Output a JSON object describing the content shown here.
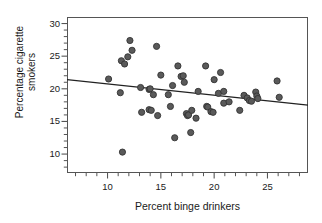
{
  "chart_data": {
    "type": "scatter",
    "title": "",
    "xlabel": "Percent binge drinkers",
    "ylabel": "Percentage cigarette smokers",
    "ylabel_lines": [
      "Percentage cigarette",
      "smokers"
    ],
    "xlim": [
      6.2,
      28.8
    ],
    "ylim": [
      7.1,
      31.0
    ],
    "xticks": [
      10,
      15,
      20,
      25
    ],
    "xtick_labels": [
      "10",
      "15",
      "20",
      "25"
    ],
    "xminor_ticks": [
      7,
      8,
      9,
      11,
      12,
      13,
      14,
      16,
      17,
      18,
      19,
      21,
      22,
      23,
      24,
      26,
      27,
      28
    ],
    "yticks": [
      10,
      15,
      20,
      25,
      30
    ],
    "ytick_labels": [
      "10",
      "15",
      "20",
      "25",
      "30"
    ],
    "yminor_ticks": [
      8,
      9,
      11,
      12,
      13,
      14,
      16,
      17,
      18,
      19,
      21,
      22,
      23,
      24,
      26,
      27,
      28,
      29
    ],
    "grid": false,
    "legend": null,
    "point_color": "#5a5a5a",
    "point_edge_color": "#333333",
    "point_radius_px": 3.1,
    "line_color": "#222222",
    "trendline": {
      "type": "linear-fit",
      "x_start": 6.2,
      "y_start": 21.4,
      "x_end": 28.8,
      "y_end": 17.5,
      "slope": -0.173,
      "intercept": 22.47
    },
    "points": [
      {
        "x": 10.1,
        "y": 21.5
      },
      {
        "x": 11.2,
        "y": 19.4
      },
      {
        "x": 11.3,
        "y": 24.3
      },
      {
        "x": 11.4,
        "y": 10.3
      },
      {
        "x": 11.6,
        "y": 23.8
      },
      {
        "x": 11.9,
        "y": 24.9
      },
      {
        "x": 12.1,
        "y": 27.4
      },
      {
        "x": 12.3,
        "y": 25.9
      },
      {
        "x": 13.1,
        "y": 20.2
      },
      {
        "x": 13.2,
        "y": 16.4
      },
      {
        "x": 13.9,
        "y": 19.9
      },
      {
        "x": 13.9,
        "y": 16.8
      },
      {
        "x": 14.0,
        "y": 20.0
      },
      {
        "x": 14.1,
        "y": 16.7
      },
      {
        "x": 14.3,
        "y": 19.1
      },
      {
        "x": 14.6,
        "y": 26.5
      },
      {
        "x": 14.7,
        "y": 15.9
      },
      {
        "x": 15.0,
        "y": 22.1
      },
      {
        "x": 15.7,
        "y": 19.1
      },
      {
        "x": 15.9,
        "y": 17.3
      },
      {
        "x": 16.1,
        "y": 20.5
      },
      {
        "x": 16.3,
        "y": 12.5
      },
      {
        "x": 16.6,
        "y": 23.5
      },
      {
        "x": 16.9,
        "y": 21.9
      },
      {
        "x": 17.1,
        "y": 22.0
      },
      {
        "x": 17.2,
        "y": 21.0
      },
      {
        "x": 17.4,
        "y": 16.2
      },
      {
        "x": 17.5,
        "y": 15.9
      },
      {
        "x": 17.6,
        "y": 16.0
      },
      {
        "x": 17.8,
        "y": 13.3
      },
      {
        "x": 17.9,
        "y": 16.7
      },
      {
        "x": 18.3,
        "y": 15.5
      },
      {
        "x": 18.5,
        "y": 19.6
      },
      {
        "x": 19.2,
        "y": 23.5
      },
      {
        "x": 19.3,
        "y": 17.3
      },
      {
        "x": 19.4,
        "y": 17.2
      },
      {
        "x": 19.7,
        "y": 16.5
      },
      {
        "x": 19.9,
        "y": 16.4
      },
      {
        "x": 20.0,
        "y": 21.4
      },
      {
        "x": 20.4,
        "y": 19.3
      },
      {
        "x": 20.6,
        "y": 22.5
      },
      {
        "x": 20.9,
        "y": 19.6
      },
      {
        "x": 20.9,
        "y": 17.8
      },
      {
        "x": 21.4,
        "y": 18.0
      },
      {
        "x": 22.4,
        "y": 16.7
      },
      {
        "x": 22.8,
        "y": 19.0
      },
      {
        "x": 23.1,
        "y": 18.6
      },
      {
        "x": 23.3,
        "y": 18.2
      },
      {
        "x": 23.5,
        "y": 18.1
      },
      {
        "x": 23.9,
        "y": 19.5
      },
      {
        "x": 24.0,
        "y": 18.9
      },
      {
        "x": 24.1,
        "y": 18.5
      },
      {
        "x": 25.9,
        "y": 21.2
      },
      {
        "x": 26.1,
        "y": 18.7
      }
    ]
  }
}
